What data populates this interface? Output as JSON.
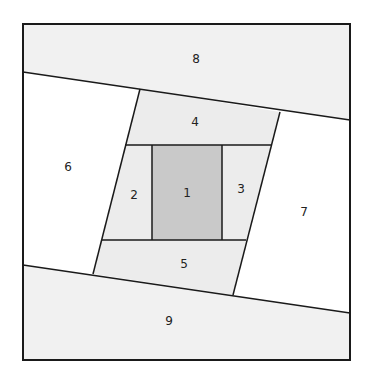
{
  "diagram": {
    "colors": {
      "outline": "#1a1a1a",
      "piece_1": "#c9c9c9",
      "inner_ring": "#ececec",
      "outer_band": "#f1f1f1",
      "side_pieces": "#ffffff"
    },
    "pieces": [
      {
        "id": "1",
        "label": "1"
      },
      {
        "id": "2",
        "label": "2"
      },
      {
        "id": "3",
        "label": "3"
      },
      {
        "id": "4",
        "label": "4"
      },
      {
        "id": "5",
        "label": "5"
      },
      {
        "id": "6",
        "label": "6"
      },
      {
        "id": "7",
        "label": "7"
      },
      {
        "id": "8",
        "label": "8"
      },
      {
        "id": "9",
        "label": "9"
      }
    ]
  }
}
